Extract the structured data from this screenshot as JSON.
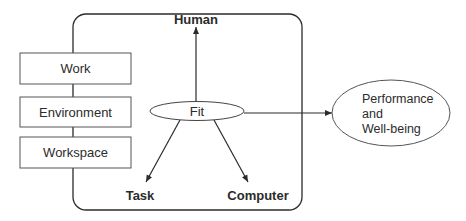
{
  "diagram": {
    "factors": [
      {
        "label": "Work"
      },
      {
        "label": "Environment"
      },
      {
        "label": "Workspace"
      }
    ],
    "center": {
      "label": "Fit"
    },
    "corners": {
      "top": "Human",
      "bottom_left": "Task",
      "bottom_right": "Computer"
    },
    "outcome": {
      "lines": [
        "Performance",
        "and",
        "Well-being"
      ]
    },
    "colors": {
      "stroke": "#2b2b2b",
      "background": "#ffffff"
    }
  }
}
